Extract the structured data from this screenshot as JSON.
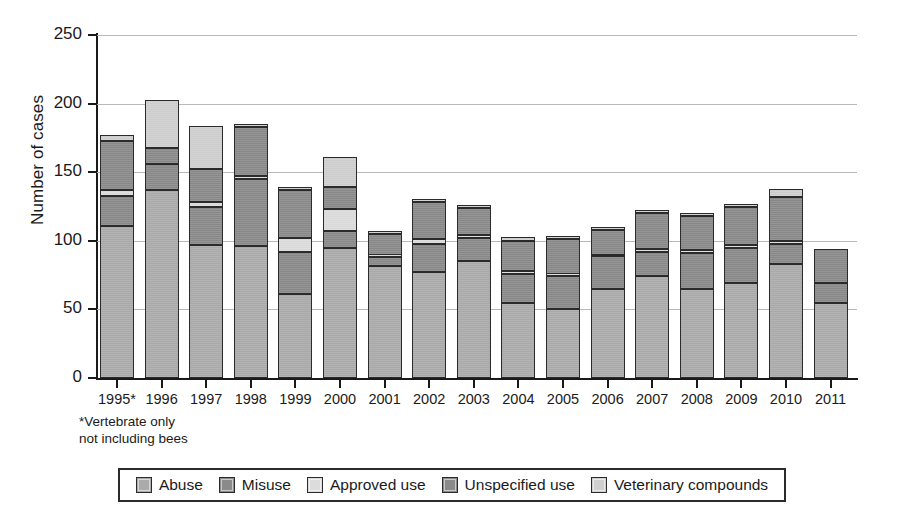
{
  "chart_data": {
    "type": "bar",
    "subtype": "stacked-bar",
    "title": "",
    "xlabel": "",
    "ylabel": "Number of cases",
    "ylim": [
      0,
      250
    ],
    "yticks": [
      0,
      50,
      100,
      150,
      200,
      250
    ],
    "grid": true,
    "legend_position": "bottom",
    "categories": [
      "1995*",
      "1996",
      "1997",
      "1998",
      "1999",
      "2000",
      "2001",
      "2002",
      "2003",
      "2004",
      "2005",
      "2006",
      "2007",
      "2008",
      "2009",
      "2010",
      "2011"
    ],
    "series": [
      {
        "name": "Abuse",
        "color": "#ababab",
        "values": [
          111,
          137,
          97,
          96,
          61,
          95,
          82,
          77,
          85,
          55,
          50,
          65,
          74,
          65,
          69,
          83,
          55
        ]
      },
      {
        "name": "Misuse",
        "color": "#8a8a8a",
        "values": [
          22,
          19,
          28,
          49,
          31,
          12,
          6,
          21,
          17,
          21,
          24,
          24,
          18,
          26,
          26,
          15,
          14
        ]
      },
      {
        "name": "Approved use",
        "color": "#dcdcdc",
        "values": [
          4,
          0,
          3,
          2,
          10,
          16,
          2,
          3,
          2,
          2,
          2,
          1,
          2,
          2,
          2,
          2,
          0
        ]
      },
      {
        "name": "Unspecified use",
        "color": "#8a8a8a",
        "values": [
          36,
          12,
          24,
          36,
          35,
          16,
          15,
          27,
          20,
          22,
          25,
          18,
          26,
          25,
          28,
          32,
          25
        ]
      },
      {
        "name": "Veterinary compounds",
        "color": "#cfcfcf",
        "values": [
          4,
          35,
          32,
          1,
          1,
          22,
          2,
          2,
          1,
          3,
          1,
          1,
          2,
          2,
          2,
          6,
          0
        ]
      }
    ],
    "totals": [
      177,
      203,
      184,
      184,
      138,
      161,
      107,
      130,
      125,
      103,
      102,
      109,
      122,
      120,
      127,
      138,
      94
    ],
    "footnote": "*Vertebrate only\nnot including bees"
  },
  "axis": {
    "y_title": "Number of cases",
    "y_ticks": [
      "250",
      "200",
      "150",
      "100",
      "50",
      "0"
    ],
    "x_ticks": [
      "1995*",
      "1996",
      "1997",
      "1998",
      "1999",
      "2000",
      "2001",
      "2002",
      "2003",
      "2004",
      "2005",
      "2006",
      "2007",
      "2008",
      "2009",
      "2010",
      "2011"
    ]
  },
  "footnote": {
    "line1": "*Vertebrate only",
    "line2": "not including bees"
  },
  "legend": {
    "items": [
      {
        "label": "Abuse",
        "color": "#ababab"
      },
      {
        "label": "Misuse",
        "color": "#8a8a8a"
      },
      {
        "label": "Approved use",
        "color": "#dcdcdc"
      },
      {
        "label": "Unspecified use",
        "color": "#8a8a8a"
      },
      {
        "label": "Veterinary compounds",
        "color": "#cfcfcf"
      }
    ]
  }
}
